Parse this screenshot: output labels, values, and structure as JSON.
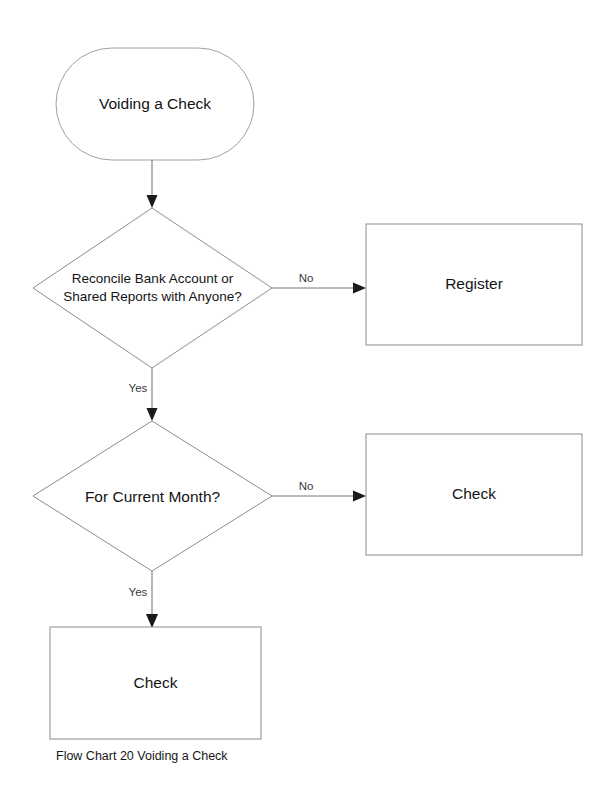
{
  "diagram": {
    "type": "flowchart",
    "caption": "Flow Chart 20 Voiding a Check",
    "colors": {
      "background": "#ffffff",
      "shape_stroke": "#8d8d8d",
      "connector_stroke": "#7a7a7a",
      "arrow_fill": "#1a1a1a",
      "text": "#141414"
    },
    "nodes": {
      "start": {
        "shape": "terminator",
        "label": "Voiding a Check"
      },
      "decision_reconcile": {
        "shape": "decision",
        "label": "Reconcile Bank Account or\nShared Reports with Anyone?"
      },
      "register": {
        "shape": "process",
        "label": "Register"
      },
      "decision_current_month": {
        "shape": "decision",
        "label": "For Current Month?"
      },
      "check_right": {
        "shape": "process",
        "label": "Check"
      },
      "check_bottom": {
        "shape": "process",
        "label": "Check"
      }
    },
    "edges": [
      {
        "from": "start",
        "to": "decision_reconcile",
        "label": ""
      },
      {
        "from": "decision_reconcile",
        "to": "register",
        "label": "No"
      },
      {
        "from": "decision_reconcile",
        "to": "decision_current_month",
        "label": "Yes"
      },
      {
        "from": "decision_current_month",
        "to": "check_right",
        "label": "No"
      },
      {
        "from": "decision_current_month",
        "to": "check_bottom",
        "label": "Yes"
      }
    ]
  }
}
